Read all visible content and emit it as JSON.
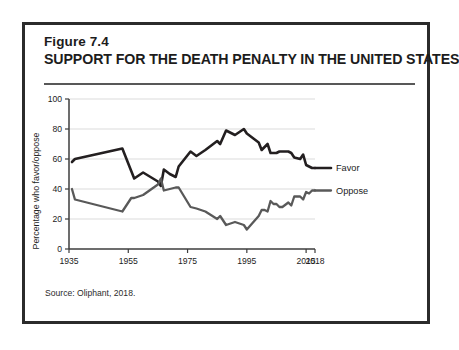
{
  "figure": {
    "number": "Figure 7.4",
    "title": "SUPPORT FOR THE DEATH PENALTY IN THE UNITED STATES",
    "source": "Source:  Oliphant, 2018."
  },
  "chart_data": {
    "type": "line",
    "title": "SUPPORT FOR THE DEATH PENALTY IN THE UNITED STATES",
    "xlabel": "",
    "ylabel": "Percentage who favor/oppose",
    "xlim": [
      1935,
      2018
    ],
    "ylim": [
      0,
      100
    ],
    "grid": true,
    "x_ticks": [
      "1935",
      "1955",
      "1975",
      "1995",
      "2015",
      "2018"
    ],
    "x_tick_values": [
      1935,
      1955,
      1975,
      1995,
      2015,
      2018
    ],
    "y_ticks": [
      "0",
      "20",
      "40",
      "60",
      "80",
      "100"
    ],
    "y_tick_values": [
      0,
      20,
      40,
      60,
      80,
      100
    ],
    "legend_position": "right-inline",
    "colors": {
      "favor": "#231f20",
      "oppose": "#595959"
    },
    "series": [
      {
        "name": "Favor",
        "color": "#231f20",
        "x": [
          1936,
          1937,
          1953,
          1956,
          1957,
          1960,
          1965,
          1966,
          1967,
          1969,
          1971,
          1972,
          1976,
          1978,
          1981,
          1985,
          1986,
          1988,
          1991,
          1994,
          1995,
          1999,
          2000,
          2001,
          2002,
          2003,
          2004,
          2005,
          2006,
          2007,
          2009,
          2010,
          2011,
          2013,
          2014,
          2015,
          2016,
          2017,
          2018
        ],
        "values": [
          58,
          60,
          67,
          52,
          47,
          51,
          45,
          42,
          53,
          50,
          48,
          55,
          65,
          62,
          66,
          72,
          70,
          79,
          76,
          80,
          77,
          71,
          66,
          68,
          70,
          64,
          64,
          64,
          65,
          65,
          65,
          64,
          61,
          60,
          63,
          56,
          55,
          54,
          54
        ]
      },
      {
        "name": "Oppose",
        "color": "#595959",
        "x": [
          1936,
          1937,
          1953,
          1956,
          1957,
          1960,
          1965,
          1966,
          1967,
          1969,
          1971,
          1972,
          1976,
          1978,
          1981,
          1985,
          1986,
          1988,
          1991,
          1994,
          1995,
          1999,
          2000,
          2001,
          2002,
          2003,
          2004,
          2005,
          2006,
          2007,
          2009,
          2010,
          2011,
          2013,
          2014,
          2015,
          2016,
          2017,
          2018
        ],
        "values": [
          40,
          33,
          25,
          34,
          34,
          36,
          43,
          47,
          39,
          40,
          41,
          41,
          28,
          27,
          25,
          20,
          22,
          16,
          18,
          16,
          13,
          22,
          26,
          26,
          25,
          32,
          30,
          30,
          28,
          28,
          31,
          29,
          35,
          35,
          33,
          38,
          37,
          39,
          39
        ]
      }
    ]
  }
}
